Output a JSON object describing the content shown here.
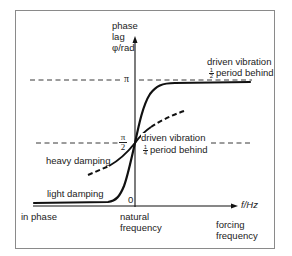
{
  "diagram": {
    "y_axis": {
      "label_line1": "phase",
      "label_line2": "lag",
      "label_line3": "φ/rad",
      "ticks": {
        "pi": "π",
        "half_pi_num": "π",
        "half_pi_den": "2",
        "zero": "0"
      }
    },
    "x_axis": {
      "label": "f/Hz",
      "caption_line1": "forcing",
      "caption_line2": "frequency",
      "natural_line1": "natural",
      "natural_line2": "frequency"
    },
    "annotations": {
      "top_right_line1": "driven vibration",
      "top_right_frac_num": "1",
      "top_right_frac_den": "2",
      "top_right_line2": "period behind",
      "mid_line1": "driven vibration",
      "mid_frac_num": "1",
      "mid_frac_den": "4",
      "mid_line2": "period behind",
      "heavy_damping": "heavy damping",
      "light_damping": "light damping",
      "in_phase": "in phase"
    },
    "curves": [
      {
        "name": "light damping",
        "style": "solid",
        "description": "stays near 0 below natural frequency, rises sharply through π/2 at natural frequency, saturates near π"
      },
      {
        "name": "heavy damping",
        "style": "dashed ends, solid middle",
        "description": "gradual rise through π/2 at natural frequency"
      }
    ],
    "colors": {
      "line": "#111111",
      "frame": "#8a8a8a",
      "text": "#222222",
      "background": "#ffffff"
    }
  }
}
